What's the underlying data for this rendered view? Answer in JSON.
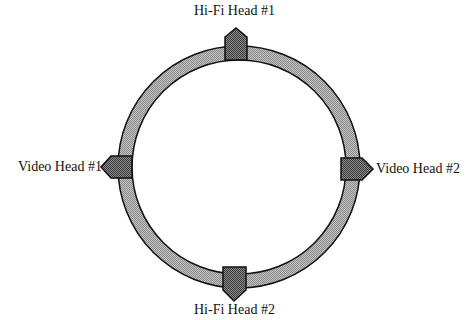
{
  "diagram": {
    "title": "",
    "drum": {
      "center": [
        239,
        167
      ],
      "outer_radius": 121,
      "inner_radius": 107,
      "fill": "#a8a8a8",
      "stroke": "#111111"
    },
    "heads": [
      {
        "id": "hifi-1",
        "label": "Hi-Fi Head #1",
        "position": "top",
        "fill": "#6e6e6e"
      },
      {
        "id": "video-1",
        "label": "Video Head #1",
        "position": "left",
        "fill": "#6e6e6e"
      },
      {
        "id": "video-2",
        "label": "Video Head #2",
        "position": "right",
        "fill": "#6e6e6e"
      },
      {
        "id": "hifi-2",
        "label": "Hi-Fi Head #2",
        "position": "bottom",
        "fill": "#6e6e6e"
      }
    ]
  }
}
